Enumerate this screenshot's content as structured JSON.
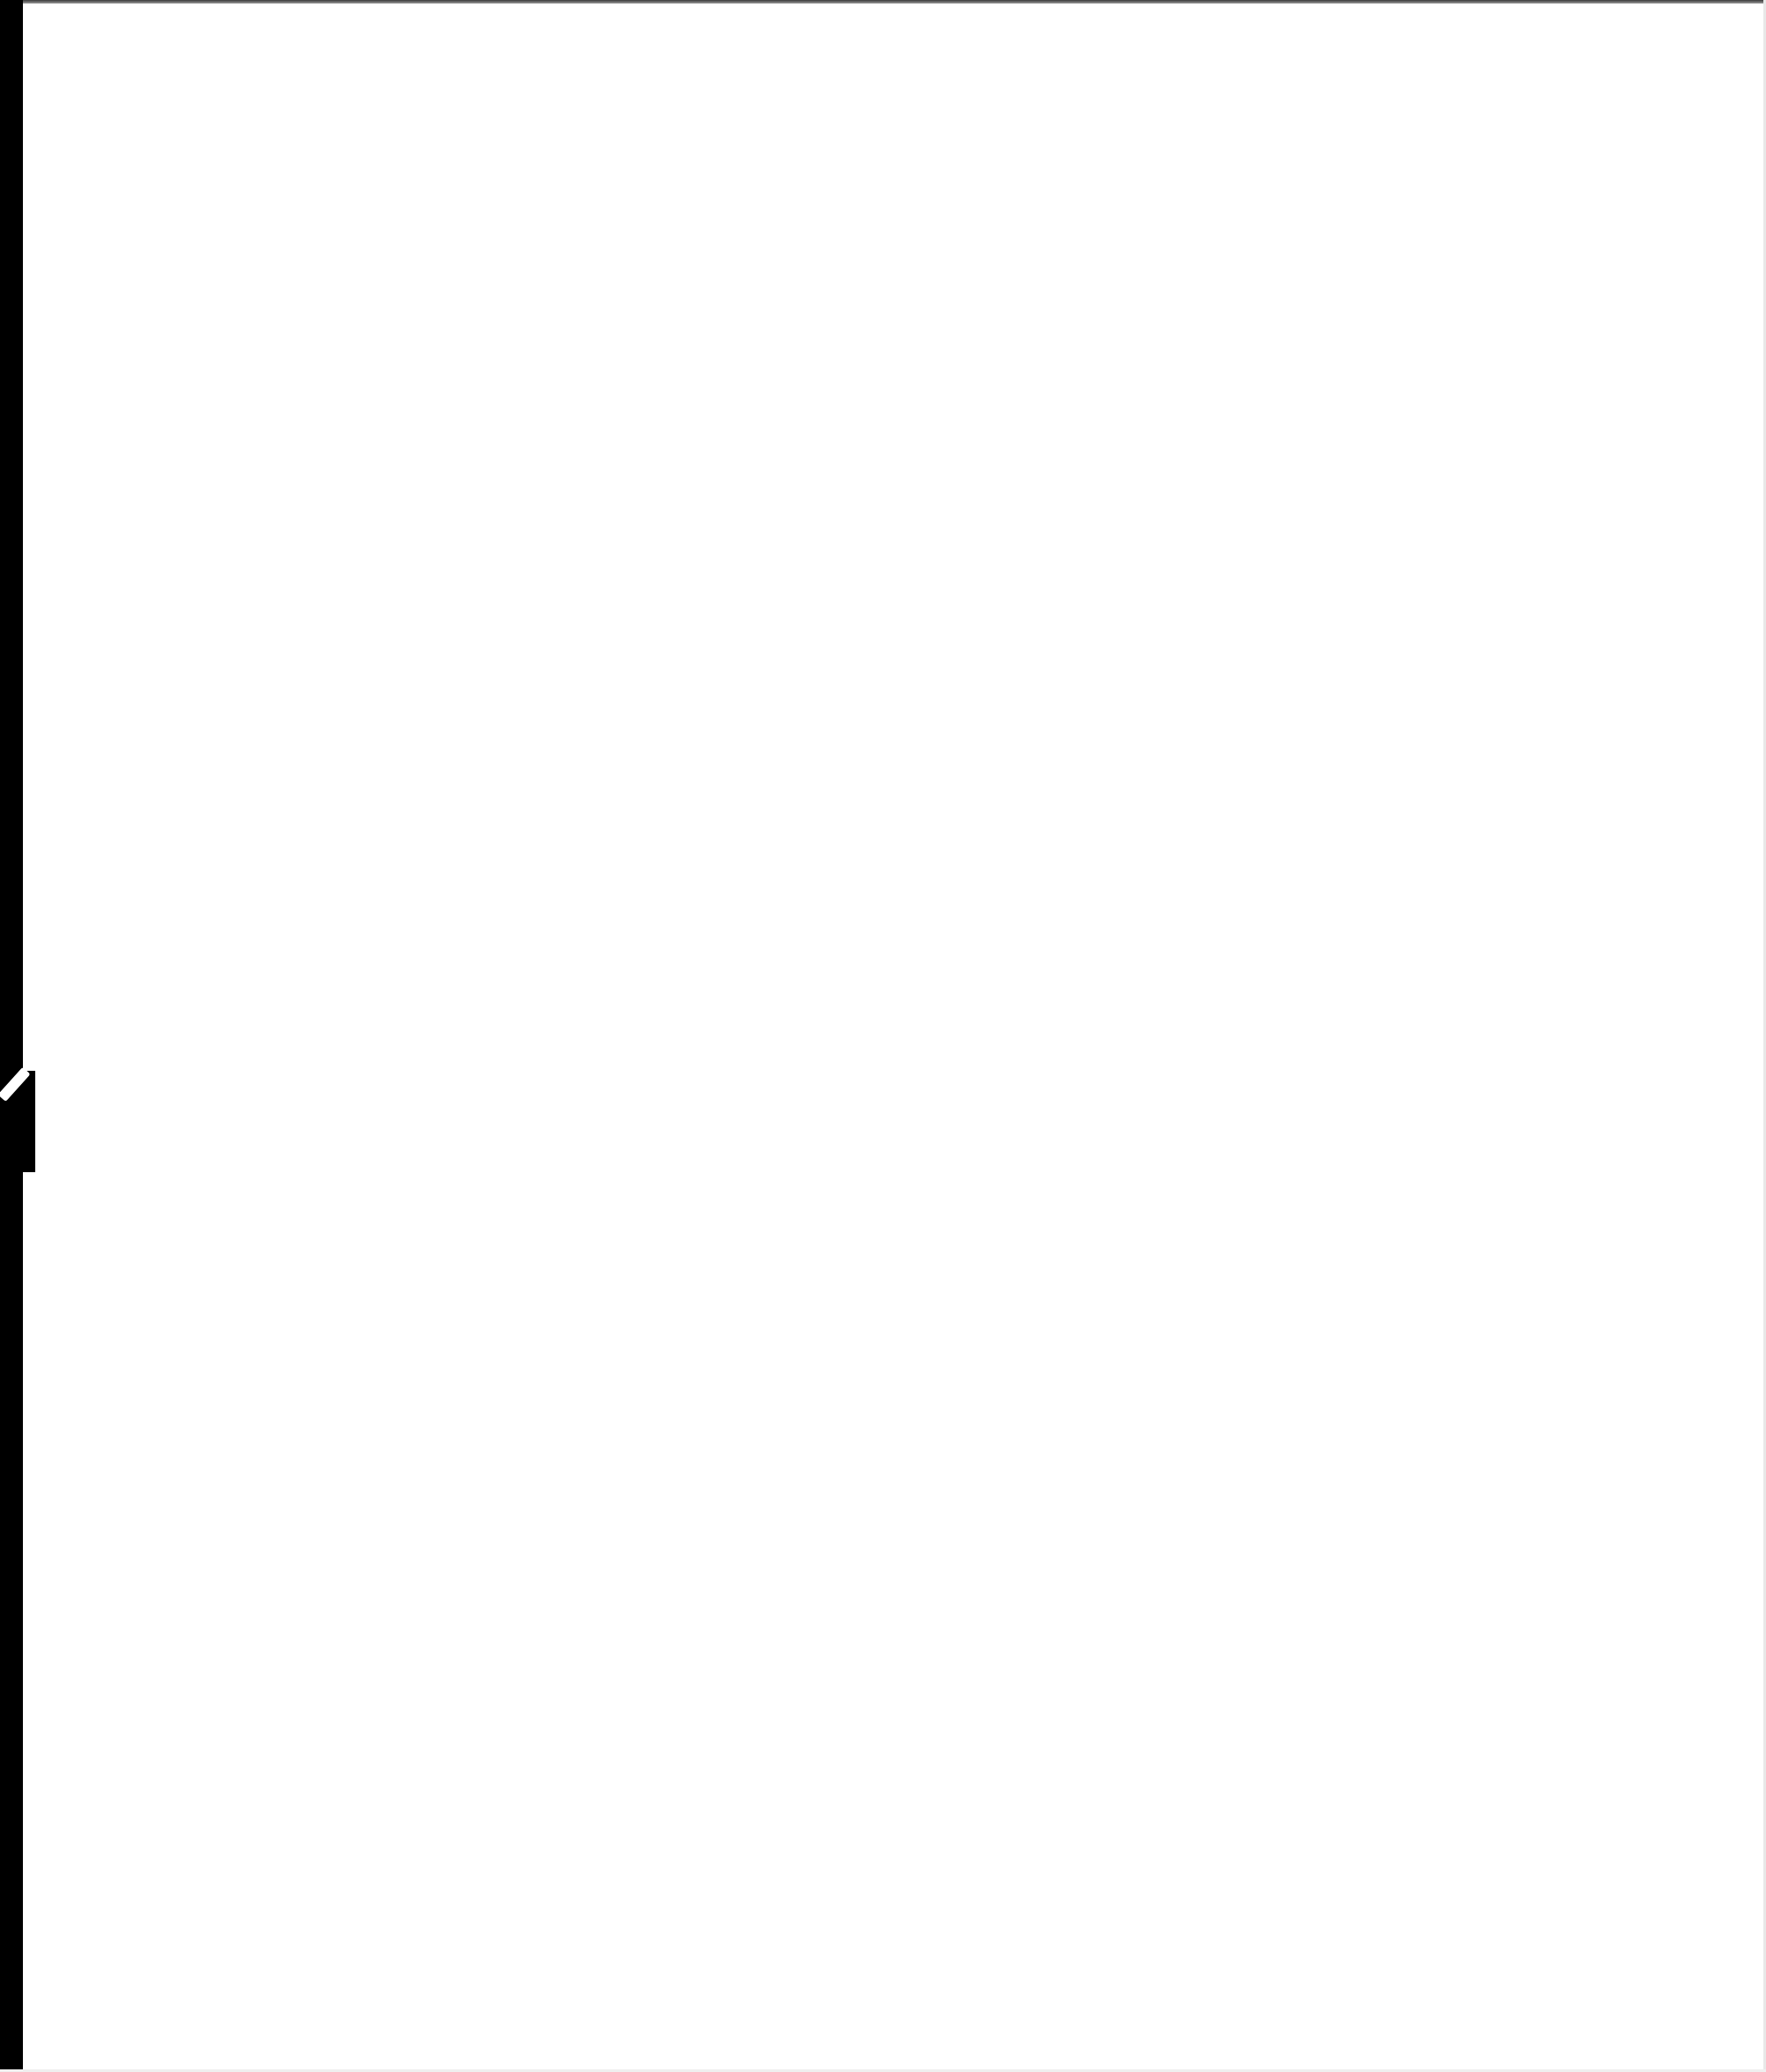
{
  "page": {
    "type": "scanned-blank-page",
    "text": "",
    "colors": {
      "background": "#ffffff",
      "border": "#000000"
    }
  }
}
